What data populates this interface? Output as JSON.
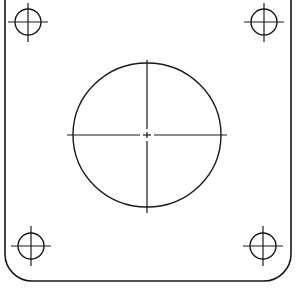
{
  "diagram": {
    "type": "technical-drawing",
    "stroke_color": "#1a1a1a",
    "background": "#ffffff",
    "plate": {
      "left": 5,
      "right": 291,
      "top": -25,
      "bottom": 281,
      "corner_radius": 27
    },
    "center_hole": {
      "cx": 147,
      "cy": 135,
      "rx": 74,
      "ry": 72,
      "centerline_extent": 80
    },
    "corner_holes": [
      {
        "id": "top-left",
        "cx": 28,
        "cy": 22,
        "r": 13
      },
      {
        "id": "top-right",
        "cx": 264,
        "cy": 22,
        "r": 13
      },
      {
        "id": "bottom-left",
        "cx": 31,
        "cy": 246,
        "r": 13
      },
      {
        "id": "bottom-right",
        "cx": 263,
        "cy": 246,
        "r": 13
      }
    ]
  }
}
